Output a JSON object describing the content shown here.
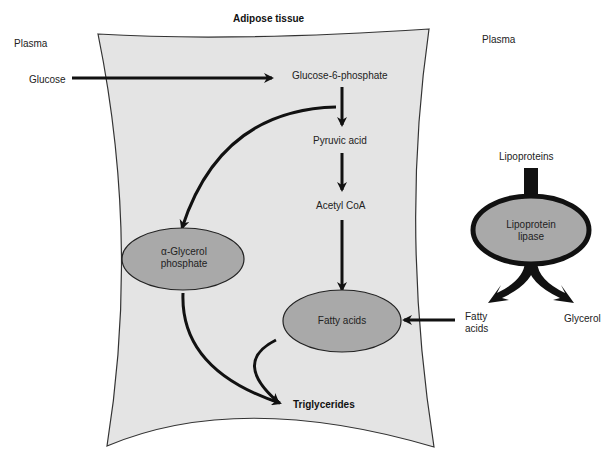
{
  "title": "Adipose tissue",
  "regions": {
    "plasma_left": "Plasma",
    "plasma_right": "Plasma"
  },
  "nodes": {
    "glucose": "Glucose",
    "glucose6p": "Glucose-6-phosphate",
    "pyruvic": "Pyruvic acid",
    "acetylcoa": "Acetyl CoA",
    "glycerol_phosphate_line1": "α-Glycerol",
    "glycerol_phosphate_line2": "phosphate",
    "fatty_acids_inside": "Fatty acids",
    "triglycerides": "Triglycerides",
    "lipoproteins": "Lipoproteins",
    "lipase_line1": "Lipoprotein",
    "lipase_line2": "lipase",
    "fatty_acids_outside_line1": "Fatty",
    "fatty_acids_outside_line2": "acids",
    "glycerol": "Glycerol"
  },
  "colors": {
    "tissue_fill": "#e4e4e4",
    "ellipse_fill": "#a9a9a9",
    "stroke": "#111111",
    "text": "#222222"
  },
  "edges": [
    {
      "from": "Glucose",
      "to": "Glucose-6-phosphate"
    },
    {
      "from": "Glucose-6-phosphate",
      "to": "Pyruvic acid"
    },
    {
      "from": "Glucose-6-phosphate",
      "to": "α-Glycerol phosphate"
    },
    {
      "from": "Pyruvic acid",
      "to": "Acetyl CoA"
    },
    {
      "from": "Acetyl CoA",
      "to": "Fatty acids"
    },
    {
      "from": "Fatty acids (plasma)",
      "to": "Fatty acids"
    },
    {
      "from": "α-Glycerol phosphate",
      "to": "Triglycerides"
    },
    {
      "from": "Fatty acids",
      "to": "Triglycerides"
    },
    {
      "from": "Lipoproteins",
      "to": "Lipoprotein lipase"
    },
    {
      "from": "Lipoprotein lipase",
      "to": "Fatty acids (plasma)"
    },
    {
      "from": "Lipoprotein lipase",
      "to": "Glycerol"
    }
  ]
}
